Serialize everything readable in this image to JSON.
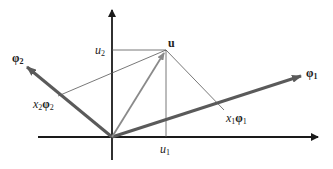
{
  "diagram": {
    "type": "vector-projection",
    "colors": {
      "axes": "#1a1a1a",
      "basis_vectors": "#5a5a5a",
      "u_vector": "#8a8a8a",
      "thin_lines": "#555555",
      "background": "#ffffff"
    },
    "labels": {
      "u": "u",
      "u1_base": "u",
      "u1_sub": "1",
      "u2_base": "u",
      "u2_sub": "2",
      "phi1_base": "φ",
      "phi1_sub": "1",
      "phi2_base": "φ",
      "phi2_sub": "2",
      "x1phi1_x": "x",
      "x1phi1_xsub": "1",
      "x1phi1_phi": "φ",
      "x1phi1_phisub": "1",
      "x2phi2_x": "x",
      "x2phi2_xsub": "2",
      "x2phi2_phi": "φ",
      "x2phi2_phisub": "2"
    }
  }
}
